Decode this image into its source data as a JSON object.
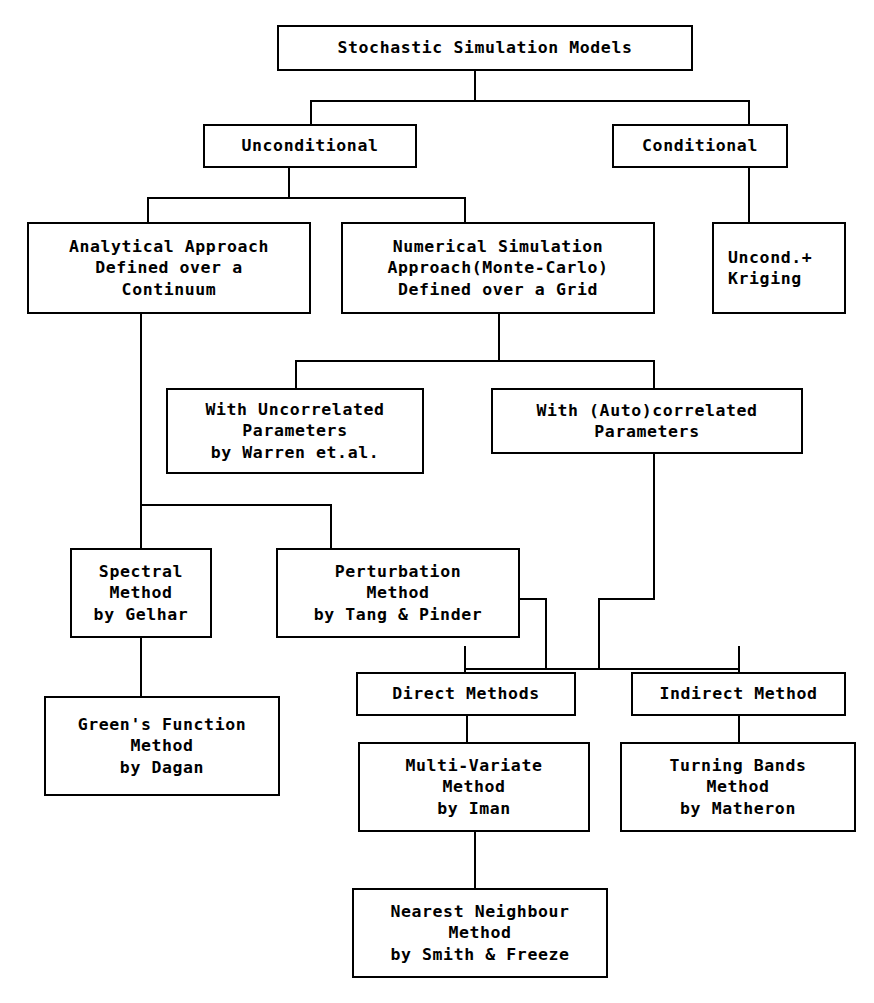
{
  "diagram": {
    "title": "Stochastic Simulation Models",
    "type": "flowchart",
    "theme": {
      "background": "#ffffff",
      "box_border": "#000000",
      "text_color": "#000000",
      "connector_color": "#000000"
    }
  },
  "nodes": [
    {
      "id": "root",
      "name": "stochastic-simulation-models",
      "lines": [
        "Stochastic Simulation Models"
      ],
      "align": "center",
      "x": 277,
      "y": 25,
      "w": 416,
      "h": 46
    },
    {
      "id": "unconditional",
      "name": "unconditional",
      "lines": [
        "Unconditional"
      ],
      "align": "center",
      "x": 203,
      "y": 124,
      "w": 214,
      "h": 44
    },
    {
      "id": "conditional",
      "name": "conditional",
      "lines": [
        "Conditional"
      ],
      "align": "center",
      "x": 612,
      "y": 124,
      "w": 176,
      "h": 44
    },
    {
      "id": "analytical",
      "name": "analytical-approach",
      "lines": [
        "Analytical Approach",
        "Defined over a",
        "Continuum"
      ],
      "align": "center",
      "x": 27,
      "y": 222,
      "w": 284,
      "h": 92
    },
    {
      "id": "numerical",
      "name": "numerical-simulation-approach",
      "lines": [
        "Numerical Simulation",
        "Approach(Monte-Carlo)",
        "Defined over a Grid"
      ],
      "align": "center",
      "x": 341,
      "y": 222,
      "w": 314,
      "h": 92
    },
    {
      "id": "uncond-kriging",
      "name": "uncond-plus-kriging",
      "lines": [
        "Uncond.+",
        "Kriging"
      ],
      "align": "left",
      "x": 712,
      "y": 222,
      "w": 134,
      "h": 92
    },
    {
      "id": "uncorrelated",
      "name": "with-uncorrelated-parameters",
      "lines": [
        "With Uncorrelated",
        "Parameters",
        "by Warren et.al."
      ],
      "align": "center",
      "x": 166,
      "y": 388,
      "w": 258,
      "h": 86
    },
    {
      "id": "autocorrelated",
      "name": "with-autocorrelated-parameters",
      "lines": [
        "With (Auto)correlated",
        "Parameters"
      ],
      "align": "center",
      "x": 491,
      "y": 388,
      "w": 312,
      "h": 66
    },
    {
      "id": "spectral",
      "name": "spectral-method-gelhar",
      "lines": [
        "Spectral",
        "Method",
        "by Gelhar"
      ],
      "align": "center",
      "x": 70,
      "y": 548,
      "w": 142,
      "h": 90
    },
    {
      "id": "perturbation",
      "name": "perturbation-method-tang-pinder",
      "lines": [
        "Perturbation",
        "Method",
        "by Tang & Pinder"
      ],
      "align": "center",
      "x": 276,
      "y": 548,
      "w": 244,
      "h": 90
    },
    {
      "id": "greens",
      "name": "greens-function-method-dagan",
      "lines": [
        "Green's Function",
        "Method",
        "by Dagan"
      ],
      "align": "center",
      "x": 44,
      "y": 696,
      "w": 236,
      "h": 100
    },
    {
      "id": "direct",
      "name": "direct-methods",
      "lines": [
        "Direct Methods"
      ],
      "align": "center",
      "x": 356,
      "y": 672,
      "w": 220,
      "h": 44
    },
    {
      "id": "indirect",
      "name": "indirect-method",
      "lines": [
        "Indirect Method"
      ],
      "align": "center",
      "x": 631,
      "y": 672,
      "w": 215,
      "h": 44
    },
    {
      "id": "multivariate",
      "name": "multi-variate-method-iman",
      "lines": [
        "Multi-Variate",
        "Method",
        "by Iman"
      ],
      "align": "center",
      "x": 358,
      "y": 742,
      "w": 232,
      "h": 90
    },
    {
      "id": "turningbands",
      "name": "turning-bands-method-matheron",
      "lines": [
        "Turning Bands",
        "Method",
        "by Matheron"
      ],
      "align": "center",
      "x": 620,
      "y": 742,
      "w": 236,
      "h": 90
    },
    {
      "id": "nearest",
      "name": "nearest-neighbour-method-smith-freeze",
      "lines": [
        "Nearest Neighbour",
        "Method",
        "by Smith & Freeze"
      ],
      "align": "center",
      "x": 352,
      "y": 888,
      "w": 256,
      "h": 90
    }
  ],
  "connectors": [
    {
      "name": "root-to-bus",
      "orient": "v",
      "x": 474,
      "y": 71,
      "len": 31
    },
    {
      "name": "level1-bus",
      "orient": "h",
      "x": 310,
      "y": 100,
      "len": 440
    },
    {
      "name": "bus-to-unconditional",
      "orient": "v",
      "x": 310,
      "y": 100,
      "len": 26
    },
    {
      "name": "bus-to-conditional",
      "orient": "v",
      "x": 748,
      "y": 100,
      "len": 26
    },
    {
      "name": "unconditional-down",
      "orient": "v",
      "x": 288,
      "y": 168,
      "len": 31
    },
    {
      "name": "level2-bus",
      "orient": "h",
      "x": 147,
      "y": 197,
      "len": 319
    },
    {
      "name": "bus-to-analytical",
      "orient": "v",
      "x": 147,
      "y": 197,
      "len": 27
    },
    {
      "name": "bus-to-numerical",
      "orient": "v",
      "x": 464,
      "y": 197,
      "len": 27
    },
    {
      "name": "conditional-to-kriging",
      "orient": "v",
      "x": 748,
      "y": 168,
      "len": 56
    },
    {
      "name": "numerical-down",
      "orient": "v",
      "x": 498,
      "y": 314,
      "len": 48
    },
    {
      "name": "level3-bus",
      "orient": "h",
      "x": 295,
      "y": 360,
      "len": 360
    },
    {
      "name": "bus-to-uncorrelated",
      "orient": "v",
      "x": 295,
      "y": 360,
      "len": 30
    },
    {
      "name": "bus-to-autocorrelated",
      "orient": "v",
      "x": 653,
      "y": 360,
      "len": 30
    },
    {
      "name": "analytical-down",
      "orient": "v",
      "x": 140,
      "y": 314,
      "len": 192
    },
    {
      "name": "level4-bus",
      "orient": "h",
      "x": 140,
      "y": 504,
      "len": 192
    },
    {
      "name": "bus-to-spectral",
      "orient": "v",
      "x": 140,
      "y": 504,
      "len": 46
    },
    {
      "name": "bus-to-perturbation",
      "orient": "v",
      "x": 330,
      "y": 504,
      "len": 46
    },
    {
      "name": "spectral-to-greens",
      "orient": "v",
      "x": 140,
      "y": 638,
      "len": 60
    },
    {
      "name": "perturbation-right-out",
      "orient": "h",
      "x": 520,
      "y": 598,
      "len": 27
    },
    {
      "name": "perturbation-right-down",
      "orient": "v",
      "x": 545,
      "y": 598,
      "len": 72
    },
    {
      "name": "autocorrelated-down",
      "orient": "v",
      "x": 653,
      "y": 454,
      "len": 146
    },
    {
      "name": "autocorrelated-left",
      "orient": "h",
      "x": 598,
      "y": 598,
      "len": 57
    },
    {
      "name": "autocorrelated-left-down",
      "orient": "v",
      "x": 598,
      "y": 598,
      "len": 72
    },
    {
      "name": "level5-bus",
      "orient": "h",
      "x": 464,
      "y": 668,
      "len": 275
    },
    {
      "name": "bus-to-direct",
      "orient": "v",
      "x": 464,
      "y": 646,
      "len": 26
    },
    {
      "name": "bus-to-indirect",
      "orient": "v",
      "x": 738,
      "y": 646,
      "len": 26
    },
    {
      "name": "direct-to-multivariate",
      "orient": "v",
      "x": 466,
      "y": 716,
      "len": 28
    },
    {
      "name": "indirect-to-turningbands",
      "orient": "v",
      "x": 738,
      "y": 716,
      "len": 28
    },
    {
      "name": "multivariate-to-nearest",
      "orient": "v",
      "x": 474,
      "y": 832,
      "len": 58
    }
  ]
}
